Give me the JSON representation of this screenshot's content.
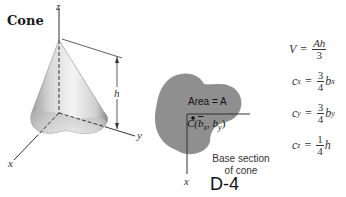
{
  "title": "Cone",
  "figure_number": "D-4",
  "cone_view": {
    "axis_labels": {
      "x": "x",
      "y": "y",
      "z": "z"
    },
    "height_label": "h"
  },
  "base_section": {
    "area_label": "Area = A",
    "centroid_label": "C(b̅x, by)",
    "centroid_text": {
      "c": "C(",
      "bx": "b",
      "bx_sub": "x",
      "sep": ", ",
      "by": "b",
      "by_sub": "y",
      "close": ")"
    },
    "axis_label_x": "x",
    "caption_line1": "Base section",
    "caption_line2": "of cone"
  },
  "formulas": [
    {
      "lhs": "V",
      "lhs_sub": "",
      "num": "Ah",
      "den": "3",
      "suffix": "",
      "suffix_sub": ""
    },
    {
      "lhs": "c",
      "lhs_sub": "x",
      "num": "3",
      "den": "4",
      "suffix": "b",
      "suffix_sub": "x"
    },
    {
      "lhs": "c",
      "lhs_sub": "y",
      "num": "3",
      "den": "4",
      "suffix": "b",
      "suffix_sub": "y"
    },
    {
      "lhs": "c",
      "lhs_sub": "z",
      "num": "1",
      "den": "4",
      "suffix": "h",
      "suffix_sub": ""
    }
  ],
  "colors": {
    "cone_shade_light": "#f2f2f2",
    "cone_shade_dark": "#8c8c8c",
    "base_fill": "#8f8f8f",
    "line": "#333333"
  }
}
